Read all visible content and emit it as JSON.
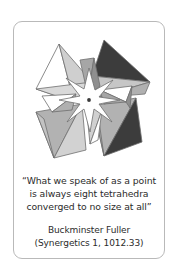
{
  "card": {
    "background_color": "#ffffff",
    "border_color": "#b9b9b9"
  },
  "figure": {
    "name": "eight-tetrahedra-converging-at-a-point",
    "center_dot_color": "#3a3a3a",
    "star_fill": "#ffffff",
    "outline_color": "#6e6e6e",
    "palette": {
      "white_face": "#ffffff",
      "light_face": "#dcdcdc",
      "mid_face": "#b4b4b4",
      "mid_dark_face": "#9a9a9a",
      "dark_face": "#3c3c3c"
    },
    "tetrahedra_count": 8
  },
  "quote": {
    "lines": [
      "“What we speak of as a point",
      "is always eight tetrahedra",
      "converged to no size at all”"
    ]
  },
  "attribution": {
    "author": "Buckminster Fuller",
    "source": "(Synergetics 1, 1012.33)"
  }
}
